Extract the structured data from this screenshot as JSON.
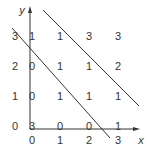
{
  "axes": {
    "x_label": "x",
    "y_label": "y",
    "x_ticks": [
      "0",
      "1",
      "2",
      "3"
    ],
    "y_ticks": [
      "3",
      "2",
      "1",
      "0"
    ]
  },
  "grid": {
    "rows": [
      {
        "y": 3,
        "values": [
          "1",
          "1",
          "3",
          "3"
        ]
      },
      {
        "y": 2,
        "values": [
          "0",
          "1",
          "1",
          "2"
        ]
      },
      {
        "y": 1,
        "values": [
          "0",
          "1",
          "1",
          "1"
        ]
      },
      {
        "y": 0,
        "values": [
          "3",
          "0",
          "0",
          "1"
        ]
      }
    ]
  },
  "colors": {
    "line": "#333333",
    "text": "#333333"
  }
}
